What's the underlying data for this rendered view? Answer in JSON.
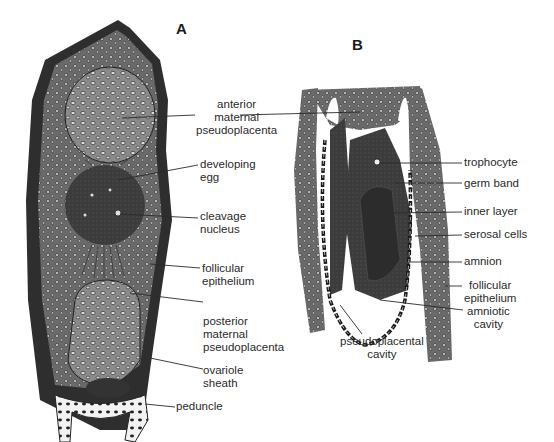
{
  "figure": {
    "panels": [
      {
        "id": "A",
        "letter": "A",
        "labels": {
          "anterior_maternal_pseudoplacenta": "anterior\nmaternal\npseudoplacenta",
          "developing_egg": "developing\negg",
          "cleavage_nucleus": "cleavage\nnucleus",
          "follicular_epithelium": "follicular\nepithelium",
          "posterior_maternal_pseudoplacenta": "posterior\nmaternal\npseudoplacenta",
          "ovariole_sheath": "ovariole\nsheath",
          "peduncle": "peduncle"
        }
      },
      {
        "id": "B",
        "letter": "B",
        "labels": {
          "trophocyte": "trophocyte",
          "germ_band": "germ band",
          "inner_layer": "inner layer",
          "serosal_cells": "serosal cells",
          "amnion": "amnion",
          "follicular_epithelium": "follicular\nepithelium",
          "amniotic_cavity": "amniotic\ncavity",
          "pseudoplacental_cavity": "pseudoplacental\ncavity"
        }
      }
    ],
    "colors": {
      "ink": "#1e1e1e",
      "tissue_dark": "#3a3a3a",
      "tissue_mid": "#6e6e6e",
      "tissue_light": "#9a9a9a",
      "background": "#ffffff"
    }
  }
}
